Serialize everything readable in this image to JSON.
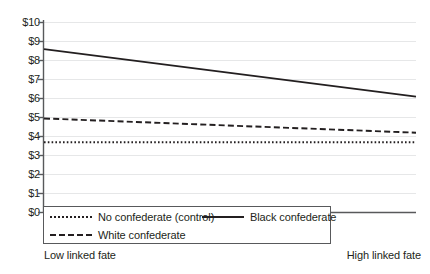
{
  "chart_data": {
    "type": "line",
    "title": "",
    "subtitle": "",
    "xlabel": "",
    "ylabel": "",
    "x": [
      0,
      1
    ],
    "x_tick_labels": [
      "Low linked fate",
      "High linked fate"
    ],
    "y_tick_labels": [
      "$0",
      "$1",
      "$2",
      "$3",
      "$4",
      "$5",
      "$6",
      "$7",
      "$8",
      "$9",
      "$10"
    ],
    "y_tick_values": [
      0,
      1,
      2,
      3,
      4,
      5,
      6,
      7,
      8,
      9,
      10
    ],
    "ylim": [
      0,
      10
    ],
    "xlim": [
      0,
      1
    ],
    "grid": "horizontal",
    "legend_position": "bottom-left-inside",
    "series": [
      {
        "name": "No confederate (control)",
        "values": [
          3.7,
          3.7
        ],
        "style": "dotted",
        "color": "#231f20"
      },
      {
        "name": "Black confederate",
        "values": [
          8.6,
          6.1
        ],
        "style": "solid",
        "color": "#231f20"
      },
      {
        "name": "White confederate",
        "values": [
          4.95,
          4.2
        ],
        "style": "dashed",
        "color": "#231f20"
      }
    ]
  },
  "axes": {
    "y_labels": [
      "$10",
      "$9",
      "$8",
      "$7",
      "$6",
      "$5",
      "$4",
      "$3",
      "$2",
      "$1",
      "$0"
    ],
    "x_label_left": "Low linked fate",
    "x_label_right": "High linked fate"
  },
  "legend": {
    "items": [
      {
        "label": "No confederate (control)",
        "style": "dotted"
      },
      {
        "label": "Black confederate",
        "style": "solid"
      },
      {
        "label": "White confederate",
        "style": "dashed"
      }
    ]
  },
  "colors": {
    "ink": "#231f20",
    "axis": "#58595b",
    "grid": "#e6e7e8",
    "background": "#ffffff"
  }
}
